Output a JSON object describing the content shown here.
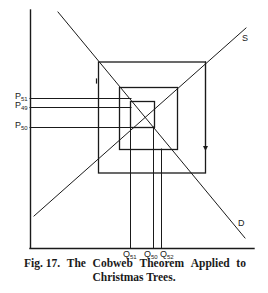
{
  "figure": {
    "type": "cobweb-diagram",
    "curves": {
      "supply_label": "S",
      "demand_label": "D"
    },
    "price_labels": [
      {
        "main": "P",
        "sub": "51"
      },
      {
        "main": "P",
        "sub": "49"
      },
      {
        "main": "P",
        "sub": "50"
      }
    ],
    "quantity_labels": [
      {
        "main": "Q",
        "sub": "51"
      },
      {
        "main": "Q",
        "sub": "50"
      },
      {
        "main": "Q",
        "sub": "52"
      }
    ]
  },
  "caption": {
    "fig": "Fig. 17.",
    "w1": "The",
    "w2": "Cobweb",
    "w3": "Theorem",
    "w4": "Applied",
    "w5": "to",
    "line2": "Christmas Trees."
  }
}
